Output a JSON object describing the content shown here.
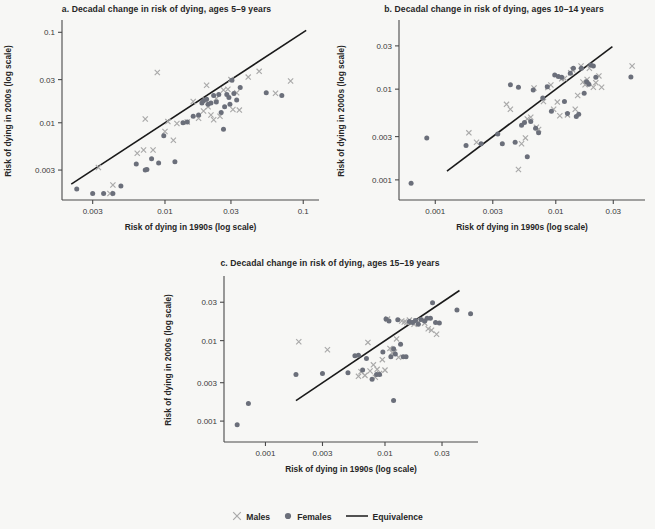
{
  "figure": {
    "background_color": "#f7f7f5",
    "male_color": "#a9a9a9",
    "female_color": "#6b6f7a",
    "line_color": "#1a1a1a",
    "axis_color": "#4a4a4a"
  },
  "legend": {
    "males_label": "Males",
    "females_label": "Females",
    "equivalence_label": "Equivalence",
    "males_symbol": "cross-marker",
    "females_symbol": "filled-circle-marker",
    "equivalence_symbol": "solid-line"
  },
  "chart_data": [
    {
      "id": "panel-a",
      "type": "scatter",
      "title": "a. Decadal change in risk of dying, ages 5–9 years",
      "xlabel": "Risk of dying in 1990s (log scale)",
      "ylabel": "Risk of dying in 2000s (log scale)",
      "xscale": "log",
      "yscale": "log",
      "xlim": [
        0.0018,
        0.13
      ],
      "ylim": [
        0.0014,
        0.13
      ],
      "xticks": [
        0.003,
        0.01,
        0.03,
        0.1
      ],
      "xticklabels": [
        "0.003",
        "0.01",
        "0.03",
        "0.1"
      ],
      "yticks": [
        0.003,
        0.01,
        0.03,
        0.1
      ],
      "yticklabels": [
        "0.003",
        "0.01",
        "0.03",
        "0.1"
      ],
      "grid": false,
      "reference_line": {
        "name": "Equivalence",
        "type": "identity",
        "x": [
          0.0021,
          0.105
        ],
        "y": [
          0.0021,
          0.105
        ]
      },
      "series": [
        {
          "name": "Males",
          "marker": "x",
          "color": "#a9a9a9",
          "points": [
            [
              0.0033,
              0.0032
            ],
            [
              0.004,
              0.00165
            ],
            [
              0.0042,
              0.00205
            ],
            [
              0.0063,
              0.0046
            ],
            [
              0.007,
              0.005
            ],
            [
              0.0072,
              0.011
            ],
            [
              0.0082,
              0.005
            ],
            [
              0.01,
              0.008
            ],
            [
              0.0105,
              0.0103
            ],
            [
              0.0115,
              0.0064
            ],
            [
              0.0122,
              0.0098
            ],
            [
              0.0145,
              0.0102
            ],
            [
              0.016,
              0.0172
            ],
            [
              0.0175,
              0.0112
            ],
            [
              0.019,
              0.0135
            ],
            [
              0.0195,
              0.018
            ],
            [
              0.02,
              0.026
            ],
            [
              0.0205,
              0.015
            ],
            [
              0.0215,
              0.0122
            ],
            [
              0.0225,
              0.0108
            ],
            [
              0.0235,
              0.0185
            ],
            [
              0.025,
              0.0118
            ],
            [
              0.0265,
              0.023
            ],
            [
              0.0285,
              0.0235
            ],
            [
              0.03,
              0.03
            ],
            [
              0.031,
              0.014
            ],
            [
              0.033,
              0.0215
            ],
            [
              0.0345,
              0.0138
            ],
            [
              0.04,
              0.032
            ],
            [
              0.048,
              0.037
            ],
            [
              0.063,
              0.0212
            ],
            [
              0.081,
              0.029
            ],
            [
              0.0088,
              0.036
            ]
          ]
        },
        {
          "name": "Females",
          "marker": "o",
          "color": "#6b6f7a",
          "points": [
            [
              0.0023,
              0.00185
            ],
            [
              0.003,
              0.00165
            ],
            [
              0.0036,
              0.00165
            ],
            [
              0.0042,
              0.00165
            ],
            [
              0.0048,
              0.002
            ],
            [
              0.0062,
              0.0035
            ],
            [
              0.0072,
              0.003
            ],
            [
              0.0074,
              0.00305
            ],
            [
              0.008,
              0.004
            ],
            [
              0.009,
              0.0036
            ],
            [
              0.0098,
              0.0072
            ],
            [
              0.0118,
              0.0037
            ],
            [
              0.0135,
              0.01
            ],
            [
              0.0145,
              0.0102
            ],
            [
              0.016,
              0.0118
            ],
            [
              0.0175,
              0.0122
            ],
            [
              0.0185,
              0.0165
            ],
            [
              0.019,
              0.0175
            ],
            [
              0.02,
              0.0182
            ],
            [
              0.0205,
              0.016
            ],
            [
              0.0215,
              0.0165
            ],
            [
              0.0225,
              0.02
            ],
            [
              0.0235,
              0.017
            ],
            [
              0.0245,
              0.0205
            ],
            [
              0.0255,
              0.013
            ],
            [
              0.027,
              0.015
            ],
            [
              0.028,
              0.0205
            ],
            [
              0.029,
              0.019
            ],
            [
              0.0295,
              0.016
            ],
            [
              0.0305,
              0.0295
            ],
            [
              0.0315,
              0.021
            ],
            [
              0.033,
              0.0178
            ],
            [
              0.035,
              0.0245
            ],
            [
              0.0265,
              0.0085
            ],
            [
              0.054,
              0.0215
            ],
            [
              0.07,
              0.02
            ]
          ]
        }
      ]
    },
    {
      "id": "panel-b",
      "type": "scatter",
      "title": "b. Decadal change in risk of dying, ages 10–14 years",
      "xlabel": "Risk of dying in 1990s (log scale)",
      "ylabel": "Risk of dying in 2000s (log scale)",
      "xscale": "log",
      "yscale": "log",
      "xlim": [
        0.0005,
        0.055
      ],
      "ylim": [
        0.0006,
        0.055
      ],
      "xticks": [
        0.001,
        0.003,
        0.01,
        0.03
      ],
      "xticklabels": [
        "0.001",
        "0.003",
        "0.01",
        "0.03"
      ],
      "yticks": [
        0.001,
        0.003,
        0.01,
        0.03
      ],
      "yticklabels": [
        "0.001",
        "0.003",
        "0.01",
        "0.03"
      ],
      "grid": false,
      "reference_line": {
        "name": "Equivalence",
        "type": "identity",
        "x": [
          0.00125,
          0.0295
        ],
        "y": [
          0.00125,
          0.0295
        ]
      },
      "series": [
        {
          "name": "Males",
          "marker": "x",
          "color": "#a9a9a9",
          "points": [
            [
              0.0019,
              0.0033
            ],
            [
              0.0022,
              0.0026
            ],
            [
              0.0039,
              0.0068
            ],
            [
              0.0042,
              0.006
            ],
            [
              0.0049,
              0.0013
            ],
            [
              0.0052,
              0.0025
            ],
            [
              0.0056,
              0.0029
            ],
            [
              0.0058,
              0.0047
            ],
            [
              0.0062,
              0.0049
            ],
            [
              0.0066,
              0.0103
            ],
            [
              0.0069,
              0.0038
            ],
            [
              0.0072,
              0.0036
            ],
            [
              0.0079,
              0.0073
            ],
            [
              0.0086,
              0.0104
            ],
            [
              0.0091,
              0.0111
            ],
            [
              0.0096,
              0.006
            ],
            [
              0.0103,
              0.0072
            ],
            [
              0.0108,
              0.0051
            ],
            [
              0.0112,
              0.013
            ],
            [
              0.0118,
              0.0131
            ],
            [
              0.0125,
              0.0052
            ],
            [
              0.0133,
              0.0152
            ],
            [
              0.0138,
              0.0163
            ],
            [
              0.0145,
              0.006
            ],
            [
              0.0152,
              0.0085
            ],
            [
              0.0162,
              0.018
            ],
            [
              0.0168,
              0.012
            ],
            [
              0.0175,
              0.0112
            ],
            [
              0.0182,
              0.0128
            ],
            [
              0.019,
              0.017
            ],
            [
              0.0205,
              0.0105
            ],
            [
              0.0215,
              0.0118
            ],
            [
              0.0228,
              0.014
            ],
            [
              0.024,
              0.0105
            ],
            [
              0.043,
              0.018
            ]
          ]
        },
        {
          "name": "Females",
          "marker": "o",
          "color": "#6b6f7a",
          "points": [
            [
              0.00063,
              0.00092
            ],
            [
              0.00085,
              0.0029
            ],
            [
              0.0018,
              0.0024
            ],
            [
              0.0024,
              0.0025
            ],
            [
              0.0033,
              0.0032
            ],
            [
              0.0036,
              0.0025
            ],
            [
              0.0042,
              0.0112
            ],
            [
              0.0046,
              0.0026
            ],
            [
              0.0049,
              0.0105
            ],
            [
              0.0052,
              0.004
            ],
            [
              0.0055,
              0.0043
            ],
            [
              0.0058,
              0.0018
            ],
            [
              0.0062,
              0.0044
            ],
            [
              0.0065,
              0.0098
            ],
            [
              0.0068,
              0.0037
            ],
            [
              0.0072,
              0.0033
            ],
            [
              0.0078,
              0.008
            ],
            [
              0.0085,
              0.0106
            ],
            [
              0.0092,
              0.0057
            ],
            [
              0.0098,
              0.0143
            ],
            [
              0.0105,
              0.0138
            ],
            [
              0.0112,
              0.0135
            ],
            [
              0.0118,
              0.0073
            ],
            [
              0.0125,
              0.0054
            ],
            [
              0.0132,
              0.015
            ],
            [
              0.014,
              0.017
            ],
            [
              0.0148,
              0.005
            ],
            [
              0.0155,
              0.0053
            ],
            [
              0.0163,
              0.017
            ],
            [
              0.0172,
              0.009
            ],
            [
              0.018,
              0.0121
            ],
            [
              0.0188,
              0.0113
            ],
            [
              0.0195,
              0.0185
            ],
            [
              0.0205,
              0.018
            ],
            [
              0.0215,
              0.0135
            ],
            [
              0.042,
              0.0136
            ]
          ]
        }
      ]
    },
    {
      "id": "panel-c",
      "type": "scatter",
      "title": "c. Decadal change in risk of dying, ages 15–19 years",
      "xlabel": "Risk of dying in 1990s (log scale)",
      "ylabel": "Risk of dying in 2000s (log scale)",
      "xscale": "log",
      "yscale": "log",
      "xlim": [
        0.00045,
        0.06
      ],
      "ylim": [
        0.00055,
        0.06
      ],
      "xticks": [
        0.001,
        0.003,
        0.01,
        0.03
      ],
      "xticklabels": [
        "0.001",
        "0.003",
        "0.01",
        "0.03"
      ],
      "yticks": [
        0.001,
        0.003,
        0.01,
        0.03
      ],
      "yticklabels": [
        "0.001",
        "0.003",
        "0.01",
        "0.03"
      ],
      "grid": false,
      "reference_line": {
        "name": "Equivalence",
        "type": "identity",
        "x": [
          0.0018,
          0.042
        ],
        "y": [
          0.0018,
          0.042
        ]
      },
      "series": [
        {
          "name": "Males",
          "marker": "x",
          "color": "#a9a9a9",
          "points": [
            [
              0.0019,
              0.0097
            ],
            [
              0.0033,
              0.0077
            ],
            [
              0.006,
              0.0036
            ],
            [
              0.0063,
              0.0041
            ],
            [
              0.0068,
              0.0037
            ],
            [
              0.0072,
              0.0095
            ],
            [
              0.0075,
              0.0042
            ],
            [
              0.008,
              0.005
            ],
            [
              0.0083,
              0.0035
            ],
            [
              0.0086,
              0.0044
            ],
            [
              0.009,
              0.0039
            ],
            [
              0.0095,
              0.0058
            ],
            [
              0.01,
              0.0043
            ],
            [
              0.0105,
              0.0185
            ],
            [
              0.011,
              0.008
            ],
            [
              0.0115,
              0.0071
            ],
            [
              0.012,
              0.0072
            ],
            [
              0.0125,
              0.0105
            ],
            [
              0.013,
              0.0062
            ],
            [
              0.0138,
              0.0175
            ],
            [
              0.0145,
              0.017
            ],
            [
              0.0152,
              0.0168
            ],
            [
              0.016,
              0.018
            ],
            [
              0.0168,
              0.0172
            ],
            [
              0.0175,
              0.016
            ],
            [
              0.0182,
              0.0175
            ],
            [
              0.019,
              0.017
            ],
            [
              0.02,
              0.0178
            ],
            [
              0.0215,
              0.0165
            ],
            [
              0.023,
              0.014
            ],
            [
              0.0245,
              0.0135
            ],
            [
              0.027,
              0.012
            ]
          ]
        },
        {
          "name": "Females",
          "marker": "o",
          "color": "#6b6f7a",
          "points": [
            [
              0.00058,
              0.0009
            ],
            [
              0.00072,
              0.00165
            ],
            [
              0.0018,
              0.0038
            ],
            [
              0.003,
              0.0039
            ],
            [
              0.0049,
              0.004
            ],
            [
              0.0056,
              0.0065
            ],
            [
              0.006,
              0.0066
            ],
            [
              0.0065,
              0.0043
            ],
            [
              0.007,
              0.006
            ],
            [
              0.0078,
              0.0033
            ],
            [
              0.0085,
              0.0038
            ],
            [
              0.009,
              0.0038
            ],
            [
              0.0096,
              0.0072
            ],
            [
              0.0102,
              0.0185
            ],
            [
              0.0108,
              0.0175
            ],
            [
              0.0112,
              0.0063
            ],
            [
              0.0118,
              0.0079
            ],
            [
              0.0122,
              0.0068
            ],
            [
              0.0128,
              0.0182
            ],
            [
              0.0135,
              0.009
            ],
            [
              0.0142,
              0.0063
            ],
            [
              0.015,
              0.0063
            ],
            [
              0.016,
              0.0173
            ],
            [
              0.017,
              0.0168
            ],
            [
              0.018,
              0.0178
            ],
            [
              0.019,
              0.016
            ],
            [
              0.02,
              0.0183
            ],
            [
              0.0215,
              0.0175
            ],
            [
              0.0225,
              0.019
            ],
            [
              0.024,
              0.019
            ],
            [
              0.025,
              0.0295
            ],
            [
              0.0265,
              0.0168
            ],
            [
              0.0285,
              0.0165
            ],
            [
              0.0118,
              0.0018
            ],
            [
              0.04,
              0.024
            ],
            [
              0.052,
              0.0215
            ]
          ]
        }
      ]
    }
  ]
}
